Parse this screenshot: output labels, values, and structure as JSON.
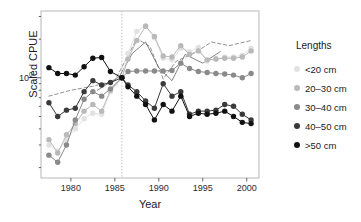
{
  "chart_data": {
    "type": "line",
    "title": "",
    "xlabel": "Year",
    "ylabel": "Scaled CPUE",
    "xlim": [
      1976.6,
      2001.4
    ],
    "ylim_log10": [
      -0.78,
      0.52
    ],
    "yscale": "log",
    "grid": false,
    "legend_position": "right",
    "legend_title": "Lengths",
    "y_tick_labels": [
      "10",
      "0"
    ],
    "y_tick_values": [
      1.0
    ],
    "x_tick_labels": [
      "1980",
      "1985",
      "1990",
      "1995",
      "2000"
    ],
    "x_tick_values": [
      1980,
      1985,
      1990,
      1995,
      2000
    ],
    "reference_line": {
      "x": 1985.8,
      "style": "dotted",
      "color": "#b4b4b4"
    },
    "colors": {
      "lt20": "#e2e2e2",
      "c20_30": "#b9b9b9",
      "c30_40": "#8a8a8a",
      "c40_50": "#3a3a3a",
      "gt50": "#111111",
      "frame": "#b0b0b0",
      "text": "#1a1a1a"
    },
    "x": [
      1977.5,
      1978.5,
      1979.5,
      1980.5,
      1981.5,
      1982.5,
      1983.5,
      1984.5,
      1985.8,
      1986.5,
      1987.5,
      1988.5,
      1989.5,
      1990.5,
      1991.5,
      1992.5,
      1993.5,
      1994.5,
      1995.5,
      1996.5,
      1997.5,
      1998.5,
      1999.5,
      2000.5
    ],
    "series": [
      {
        "name": "<20 cm",
        "color": "#e2e2e2",
        "values": [
          0.3,
          0.27,
          0.33,
          0.4,
          0.48,
          0.53,
          0.52,
          0.78,
          1.0,
          1.55,
          2.3,
          2.55,
          2.05,
          1.42,
          1.38,
          1.7,
          1.6,
          1.72,
          1.35,
          1.4,
          1.45,
          1.45,
          1.5,
          1.7
        ]
      },
      {
        "name": "20–30 cm",
        "color": "#b9b9b9",
        "values": [
          0.33,
          0.26,
          0.36,
          0.44,
          0.55,
          0.62,
          0.55,
          0.8,
          1.0,
          1.4,
          1.95,
          2.52,
          2.1,
          1.48,
          1.45,
          1.78,
          1.52,
          1.62,
          1.38,
          1.4,
          1.42,
          1.42,
          1.45,
          1.62
        ]
      },
      {
        "name": "30–40 cm",
        "color": "#8a8a8a",
        "values": [
          0.25,
          0.22,
          0.3,
          0.47,
          0.68,
          0.78,
          0.72,
          0.82,
          1.0,
          1.12,
          1.13,
          1.13,
          1.13,
          1.13,
          1.14,
          1.3,
          1.18,
          1.12,
          1.1,
          1.08,
          1.07,
          1.05,
          1.0,
          1.08
        ]
      },
      {
        "name": "40–50 cm",
        "color": "#3a3a3a",
        "values": [
          0.64,
          0.5,
          0.56,
          0.58,
          0.78,
          0.95,
          0.88,
          0.92,
          1.0,
          0.88,
          0.78,
          0.66,
          0.58,
          0.9,
          0.72,
          0.78,
          0.52,
          0.55,
          0.55,
          0.56,
          0.62,
          0.6,
          0.52,
          0.47
        ]
      },
      {
        "name": ">50 cm",
        "color": "#111111",
        "values": [
          1.2,
          1.08,
          1.08,
          1.05,
          1.22,
          1.42,
          1.44,
          1.12,
          1.0,
          0.85,
          0.72,
          0.62,
          0.47,
          0.62,
          0.55,
          0.72,
          0.5,
          0.53,
          0.52,
          0.53,
          0.55,
          0.5,
          0.45,
          0.44
        ]
      }
    ],
    "fit_lines": [
      {
        "name": "fit-lt20",
        "color": "#777777",
        "style": "dashed",
        "x": [
          1977.5,
          1980.0,
          1982.5,
          1985.0,
          1987.5,
          1989.0,
          1990.5,
          1992.0,
          1994.0,
          1996.0,
          1998.0,
          2000.5
        ],
        "values": [
          0.72,
          0.8,
          0.86,
          0.95,
          2.02,
          1.75,
          0.98,
          1.35,
          1.55,
          1.9,
          1.78,
          1.95
        ]
      },
      {
        "name": "fit-c20_30",
        "color": "#666666",
        "style": "solid",
        "x": [
          1983.0,
          1985.5,
          1987.0,
          1988.5,
          1990.0,
          1991.5,
          1993.0,
          1995.0,
          1997.0
        ],
        "values": [
          0.8,
          1.02,
          1.55,
          1.9,
          1.2,
          0.95,
          1.52,
          1.3,
          1.6
        ]
      }
    ]
  },
  "legend": {
    "title": "Lengths",
    "items": [
      {
        "label": "<20 cm",
        "color": "#e2e2e2"
      },
      {
        "label": "20–30 cm",
        "color": "#b9b9b9"
      },
      {
        "label": "30–40 cm",
        "color": "#8a8a8a"
      },
      {
        "label": "40–50 cm",
        "color": "#3a3a3a"
      },
      {
        "label": ">50 cm",
        "color": "#111111"
      }
    ]
  },
  "axes": {
    "ylabel": "Scaled CPUE",
    "xlabel": "Year",
    "ytick_mantissa": "10",
    "ytick_exponent": "0",
    "xticks": [
      "1980",
      "1985",
      "1990",
      "1995",
      "2000"
    ]
  }
}
